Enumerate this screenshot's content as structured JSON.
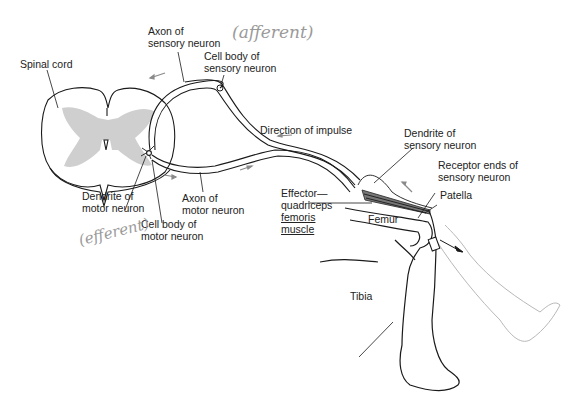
{
  "diagram": {
    "labels": {
      "spinal_cord": "Spinal cord",
      "axon_sensory_1": "Axon of",
      "axon_sensory_2": "sensory neuron",
      "cell_body_sensory_1": "Cell body of",
      "cell_body_sensory_2": "sensory neuron",
      "direction": "Direction of impulse",
      "dendrite_sensory_1": "Dendrite of",
      "dendrite_sensory_2": "sensory neuron",
      "receptor_1": "Receptor ends of",
      "receptor_2": "sensory neuron",
      "patella": "Patella",
      "effector_1": "Effector—",
      "effector_2": "quadriceps",
      "effector_3": "femoris",
      "effector_4": "muscle",
      "femur": "Femur",
      "tibia": "Tibia",
      "dendrite_motor_1": "Dendrite of",
      "dendrite_motor_2": "motor neuron",
      "axon_motor_1": "Axon of",
      "axon_motor_2": "motor neuron",
      "cell_body_motor_1": "Cell body of",
      "cell_body_motor_2": "motor neuron"
    },
    "annotations": {
      "afferent": "(afferent)",
      "efferent": "(efferent)"
    },
    "colors": {
      "line": "#1a1a1a",
      "gray_matter": "#cfcfcf",
      "arrow": "#8a8a8a",
      "ghost_leg": "#b8b8b8"
    }
  }
}
